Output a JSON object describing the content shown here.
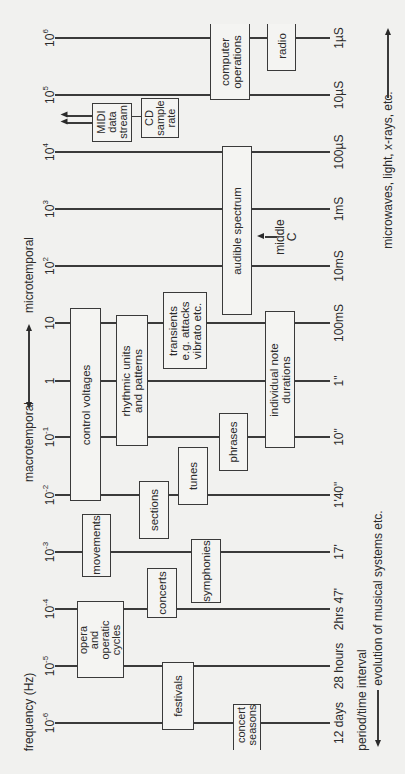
{
  "axes": {
    "left_title": "frequency (Hz)",
    "right_title": "period/time interval",
    "upper_left_label": "microtemporal",
    "lower_left_label": "macrotemporal",
    "right_upper_note": "microwaves, light, x-rays, etc.",
    "right_lower_note": "evolution of musical systems etc."
  },
  "scale": [
    {
      "freq_base": "10",
      "freq_exp": "6",
      "period": "1µS"
    },
    {
      "freq_base": "10",
      "freq_exp": "5",
      "period": "10µS"
    },
    {
      "freq_base": "10",
      "freq_exp": "4",
      "period": "100µS"
    },
    {
      "freq_base": "10",
      "freq_exp": "3",
      "period": "1mS"
    },
    {
      "freq_base": "10",
      "freq_exp": "2",
      "period": "10mS"
    },
    {
      "freq_base": "10",
      "freq_exp": "",
      "period": "100mS"
    },
    {
      "freq_base": "1",
      "freq_exp": "",
      "period": "1\""
    },
    {
      "freq_base": "10",
      "freq_exp": "-1",
      "period": "10\""
    },
    {
      "freq_base": "10",
      "freq_exp": "-2",
      "period": "1'40\""
    },
    {
      "freq_base": "10",
      "freq_exp": "-3",
      "period": "17'"
    },
    {
      "freq_base": "10",
      "freq_exp": "-4",
      "period": "2hrs 47'"
    },
    {
      "freq_base": "10",
      "freq_exp": "-5",
      "period": "28 hours"
    },
    {
      "freq_base": "10",
      "freq_exp": "-6",
      "period": "12 days"
    }
  ],
  "boxes": {
    "computer_operations": "computer\noperations",
    "radio": "radio",
    "midi": "MIDI\ndata\nstream",
    "cd": "CD\nsample\nrate",
    "audible": "audible spectrum",
    "middle_c": "middle\nC",
    "transients": "transients\ne.g. attacks\nvibrato etc.",
    "control_voltages": "control voltages",
    "rhythmic": "rhythmic units\nand patterns",
    "note_durations": "individual note\ndurations",
    "phrases": "phrases",
    "tunes": "tunes",
    "sections": "sections",
    "movements": "movements",
    "symphonies": "symphonies",
    "concerts": "concerts",
    "opera": "opera\nand\noperatic\ncycles",
    "festivals": "festivals",
    "concert_seasons": "concert\nseasons"
  }
}
